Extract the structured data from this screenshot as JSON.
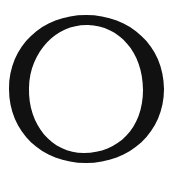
{
  "glyph": {
    "character": "O",
    "style": "serif capital letter",
    "color": "#111111",
    "background": "#ffffff"
  }
}
